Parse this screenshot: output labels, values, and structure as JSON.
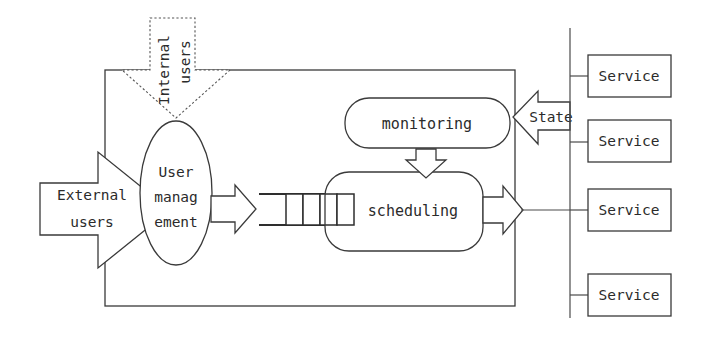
{
  "diagram": {
    "colors": {
      "stroke": "#3a3a3a",
      "dashed_stroke": "#555555",
      "text": "#2b2b2b",
      "background": "#ffffff"
    },
    "external_users_arrow": {
      "label_line1": "External",
      "label_line2": "users",
      "direction": "right",
      "style": "solid"
    },
    "internal_users_arrow": {
      "label_line1": "Internal",
      "label_line2": "users",
      "direction": "down",
      "style": "dashed",
      "text_rotation_degrees": -90
    },
    "user_management_node": {
      "label_line1": "User",
      "label_line2": "manag",
      "label_line3": "ement",
      "shape": "ellipse"
    },
    "queue": {
      "cell_count": 4,
      "shape": "open-ended-queue"
    },
    "scheduling_node": {
      "label": "scheduling",
      "shape": "rounded-rectangle"
    },
    "monitoring_node": {
      "label": "monitoring",
      "shape": "rounded-rectangle"
    },
    "state_arrow": {
      "label": "State",
      "direction": "left",
      "style": "solid"
    },
    "dispatch_arrow": {
      "direction": "right",
      "style": "solid"
    },
    "feedback_arrow": {
      "direction": "down",
      "style": "solid"
    },
    "services": [
      {
        "label": "Service"
      },
      {
        "label": "Service"
      },
      {
        "label": "Service"
      },
      {
        "label": "Service"
      }
    ]
  }
}
